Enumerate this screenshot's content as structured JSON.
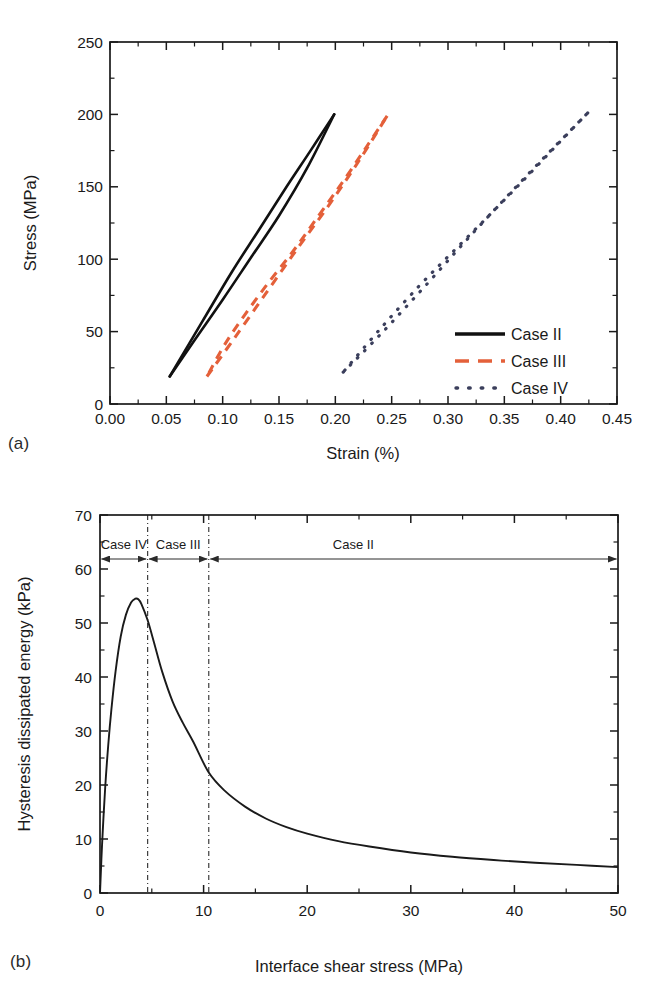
{
  "figure": {
    "panel_a_tag": "(a)",
    "panel_b_tag": "(b)"
  },
  "chart_data": [
    {
      "id": "panel-a",
      "type": "line",
      "title": "",
      "xlabel": "Strain (%)",
      "ylabel": "Stress (MPa)",
      "xlim": [
        0.0,
        0.45
      ],
      "ylim": [
        0,
        250
      ],
      "xticks": [
        0.0,
        0.05,
        0.1,
        0.15,
        0.2,
        0.25,
        0.3,
        0.35,
        0.4,
        0.45
      ],
      "xticklabels": [
        "0.00",
        "0.05",
        "0.10",
        "0.15",
        "0.20",
        "0.25",
        "0.30",
        "0.35",
        "0.40",
        "0.45"
      ],
      "yticks": [
        0,
        50,
        100,
        150,
        200,
        250
      ],
      "yticklabels": [
        "0",
        "50",
        "100",
        "150",
        "200",
        "250"
      ],
      "minor_xticks": [
        0.025,
        0.075,
        0.125,
        0.175,
        0.225,
        0.275,
        0.325,
        0.375,
        0.425
      ],
      "minor_yticks": [
        25,
        75,
        125,
        175,
        225
      ],
      "grid": false,
      "legend_position": "lower-right",
      "series": [
        {
          "name": "Case II",
          "style": "solid",
          "color": "#111111",
          "description": "narrow hysteresis loop",
          "loading_branch": {
            "x": [
              0.053,
              0.075,
              0.1,
              0.125,
              0.15,
              0.175,
              0.199
            ],
            "y": [
              19,
              44,
              72,
              101,
              130,
              163,
              200
            ]
          },
          "unloading_branch": {
            "x": [
              0.199,
              0.178,
              0.155,
              0.132,
              0.108,
              0.082,
              0.053
            ],
            "y": [
              200,
              175,
              148,
              120,
              91,
              57,
              19
            ]
          }
        },
        {
          "name": "Case III",
          "style": "dashed",
          "color": "#e4603a",
          "description": "medium hysteresis loop",
          "loading_branch": {
            "x": [
              0.086,
              0.11,
              0.138,
              0.166,
              0.194,
              0.221,
              0.246
            ],
            "y": [
              19,
              45,
              76,
              107,
              137,
              168,
              199
            ]
          },
          "unloading_branch": {
            "x": [
              0.246,
              0.228,
              0.208,
              0.186,
              0.162,
              0.135,
              0.105,
              0.086
            ],
            "y": [
              199,
              178,
              155,
              131,
              105,
              78,
              45,
              19
            ]
          }
        },
        {
          "name": "Case IV",
          "style": "dotted",
          "color": "#3b3f5c",
          "description": "wide hysteresis loop",
          "loading_branch": {
            "x": [
              0.207,
              0.24,
              0.278,
              0.315,
              0.352,
              0.39,
              0.424
            ],
            "y": [
              22,
              48,
              80,
              112,
              143,
              174,
              201
            ]
          },
          "unloading_branch": {
            "x": [
              0.424,
              0.398,
              0.37,
              0.34,
              0.308,
              0.275,
              0.24,
              0.207
            ],
            "y": [
              201,
              180,
              157,
              133,
              108,
              82,
              52,
              22
            ]
          }
        }
      ],
      "legend": [
        {
          "label": "Case II",
          "style": "solid",
          "color": "#111111"
        },
        {
          "label": "Case III",
          "style": "dashed",
          "color": "#e4603a"
        },
        {
          "label": "Case IV",
          "style": "dotted",
          "color": "#3b3f5c"
        }
      ]
    },
    {
      "id": "panel-b",
      "type": "line",
      "title": "",
      "xlabel": "Interface shear stress (MPa)",
      "ylabel": "Hysteresis dissipated energy (kPa)",
      "xlim": [
        0,
        50
      ],
      "ylim": [
        0,
        70
      ],
      "xticks": [
        0,
        10,
        20,
        30,
        40,
        50
      ],
      "xticklabels": [
        "0",
        "10",
        "20",
        "30",
        "40",
        "50"
      ],
      "yticks": [
        0,
        10,
        20,
        30,
        40,
        50,
        60,
        70
      ],
      "yticklabels": [
        "0",
        "10",
        "20",
        "30",
        "40",
        "50",
        "60",
        "70"
      ],
      "minor_xticks": [
        5,
        15,
        25,
        35,
        45
      ],
      "minor_yticks": [
        5,
        15,
        25,
        35,
        45,
        55,
        65
      ],
      "grid": false,
      "legend_position": "none",
      "series": [
        {
          "name": "Hysteresis dissipated energy",
          "style": "solid",
          "color": "#1a1a1a",
          "x": [
            0.0,
            0.2,
            0.5,
            0.8,
            1.1,
            1.5,
            2.0,
            2.5,
            3.0,
            3.4,
            3.7,
            4.0,
            4.6,
            5.2,
            6.0,
            7.0,
            8.0,
            9.0,
            10.5,
            12.0,
            14.0,
            16.0,
            18.0,
            20.0,
            23.0,
            26.0,
            30.0,
            34.0,
            38.0,
            42.0,
            46.0,
            50.0
          ],
          "y": [
            0.0,
            9.0,
            19.5,
            27.5,
            34.0,
            41.0,
            47.5,
            51.5,
            53.8,
            54.5,
            54.4,
            53.5,
            50.5,
            46.5,
            41.0,
            35.5,
            31.5,
            28.0,
            22.3,
            19.0,
            16.0,
            13.8,
            12.2,
            11.0,
            9.6,
            8.6,
            7.5,
            6.7,
            6.1,
            5.6,
            5.2,
            4.8
          ]
        }
      ],
      "vertical_markers": [
        {
          "x": 4.6,
          "style": "dash-dot"
        },
        {
          "x": 10.5,
          "style": "dash-dot"
        }
      ],
      "annotations": [
        {
          "label": "Case IV",
          "range_start": 0,
          "range_end": 4.6
        },
        {
          "label": "Case III",
          "range_start": 4.6,
          "range_end": 10.5
        },
        {
          "label": "Case II",
          "range_start": 10.5,
          "range_end": 50
        }
      ]
    }
  ]
}
